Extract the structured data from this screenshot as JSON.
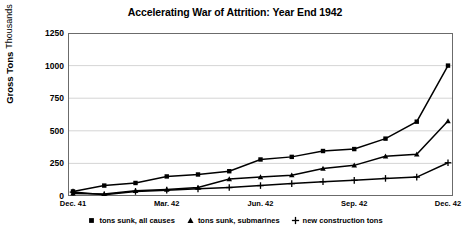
{
  "chart_data": {
    "type": "line",
    "title": "Accelerating War of Attrition: Year End 1942",
    "xlabel": "",
    "ylabel": "Gross Tons",
    "ylabel_sub": "Thousands",
    "ylim": [
      0,
      1250
    ],
    "yticks": [
      0,
      250,
      500,
      750,
      1000,
      1250
    ],
    "ytick_labels": [
      "0",
      "250",
      "500",
      "750",
      "1000",
      "1250"
    ],
    "grid": true,
    "grid_axis": "y",
    "legend_position": "bottom",
    "x": [
      "Dec. 41",
      "Jan. 42",
      "Feb. 42",
      "Mar. 42",
      "Apr. 42",
      "May 42",
      "Jun. 42",
      "Jul. 42",
      "Aug. 42",
      "Sep. 42",
      "Oct. 42",
      "Nov. 42",
      "Dec. 42"
    ],
    "xtick_labels": [
      "Dec. 41",
      "Mar. 42",
      "Jun. 42",
      "Sep. 42",
      "Dec. 42"
    ],
    "xtick_positions": [
      0,
      3,
      6,
      9,
      12
    ],
    "series": [
      {
        "name": "tons sunk, all causes",
        "marker": "square",
        "color": "#000000",
        "values": [
          35,
          80,
          100,
          150,
          165,
          190,
          280,
          300,
          345,
          360,
          440,
          570,
          1000
        ]
      },
      {
        "name": "tons sunk, submarines",
        "marker": "triangle",
        "color": "#000000",
        "values": [
          20,
          15,
          40,
          50,
          65,
          130,
          145,
          160,
          210,
          235,
          305,
          320,
          575
        ]
      },
      {
        "name": "new construction tons",
        "marker": "plus",
        "color": "#000000",
        "values": [
          30,
          10,
          35,
          45,
          55,
          65,
          80,
          95,
          110,
          120,
          135,
          145,
          255
        ]
      }
    ]
  },
  "legend": {
    "items": [
      {
        "label": "tons sunk, all causes",
        "marker": "square"
      },
      {
        "label": "tons sunk, submarines",
        "marker": "triangle"
      },
      {
        "label": "new construction tons",
        "marker": "plus"
      }
    ]
  }
}
